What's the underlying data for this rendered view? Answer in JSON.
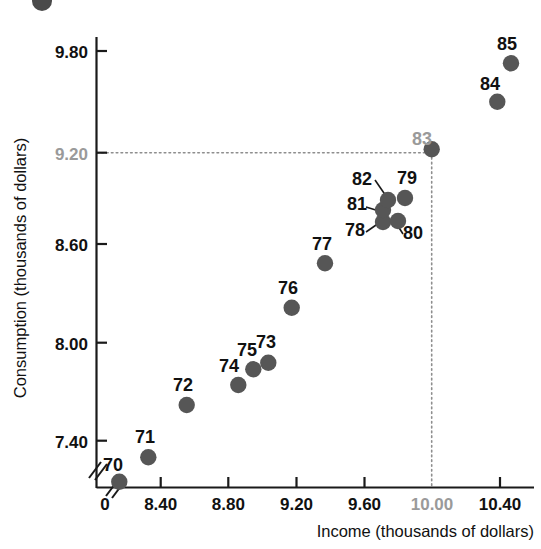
{
  "chart_data": {
    "type": "scatter",
    "title": "",
    "xlabel": "Income (thousands of dollars)",
    "ylabel": "Consumption (thousands of dollars)",
    "xlim": [
      8.1,
      9.3
    ],
    "ylim": [
      7.1,
      9.85
    ],
    "grid": false,
    "legend": "none",
    "axis_break_x": true,
    "axis_break_y": true,
    "x_origin_label": "0",
    "xticks": [
      8.4,
      8.8,
      9.2,
      9.6,
      10.0,
      10.4
    ],
    "xticklabels": [
      "8.40",
      "8.80",
      "9.20",
      "9.60",
      "10.00",
      "10.40"
    ],
    "yticks": [
      7.4,
      8.0,
      8.6,
      9.2,
      9.8
    ],
    "yticklabels": [
      "7.40",
      "8.00",
      "8.60",
      "9.20",
      "9.80"
    ],
    "highlighted_xtick": "10.00",
    "highlighted_ytick": "9.20",
    "highlighted_point": "83",
    "guide_lines": {
      "x": 10.0,
      "y": 9.2,
      "style": "dotted",
      "color": "#8e8e8e"
    },
    "point_color": "#565656",
    "label_color": "#111111",
    "highlight_color": "#9a9a9a",
    "points": [
      {
        "label": "70",
        "x": 8.16,
        "y": 7.15,
        "px": 119.3,
        "py": 481.7,
        "lx": 103,
        "ly": 471,
        "leader": false,
        "highlight": false
      },
      {
        "label": "71",
        "x": 8.32,
        "y": 7.4,
        "px": 148.3,
        "py": 457.3,
        "lx": 135,
        "ly": 443,
        "leader": false,
        "highlight": false
      },
      {
        "label": "72",
        "x": 8.46,
        "y": 7.77,
        "px": 186.7,
        "py": 405.0,
        "lx": 173,
        "ly": 391,
        "leader": false,
        "highlight": false
      },
      {
        "label": "73",
        "x": 8.66,
        "y": 7.88,
        "px": 268.3,
        "py": 362.7,
        "lx": 256,
        "ly": 348,
        "leader": false,
        "highlight": false
      },
      {
        "label": "74",
        "x": 8.58,
        "y": 7.74,
        "px": 238.3,
        "py": 385.0,
        "lx": 219,
        "ly": 372,
        "leader": false,
        "highlight": false
      },
      {
        "label": "75",
        "x": 8.62,
        "y": 7.84,
        "px": 253.3,
        "py": 369.3,
        "lx": 237,
        "ly": 356,
        "leader": false,
        "highlight": false
      },
      {
        "label": "76",
        "x": 8.71,
        "y": 8.16,
        "px": 291.7,
        "py": 307.7,
        "lx": 278,
        "ly": 294,
        "leader": false,
        "highlight": false
      },
      {
        "label": "77",
        "x": 8.79,
        "y": 8.53,
        "px": 325.0,
        "py": 263.3,
        "lx": 312,
        "ly": 250,
        "leader": false,
        "highlight": false
      },
      {
        "label": "78",
        "x": 8.93,
        "y": 8.75,
        "px": 383.0,
        "py": 222.0,
        "lx": 345,
        "ly": 236,
        "leader": true,
        "highlight": false
      },
      {
        "label": "79",
        "x": 9.0,
        "y": 8.89,
        "px": 405.0,
        "py": 198.0,
        "lx": 397,
        "ly": 184,
        "leader": false,
        "highlight": false
      },
      {
        "label": "80",
        "x": 8.97,
        "y": 8.76,
        "px": 398.0,
        "py": 221.0,
        "lx": 403,
        "ly": 239,
        "leader": true,
        "highlight": false
      },
      {
        "label": "81",
        "x": 8.93,
        "y": 8.82,
        "px": 383.0,
        "py": 210.0,
        "lx": 347,
        "ly": 210,
        "leader": true,
        "highlight": false
      },
      {
        "label": "82",
        "x": 8.95,
        "y": 8.88,
        "px": 388.0,
        "py": 200.0,
        "lx": 352,
        "ly": 185,
        "leader": true,
        "highlight": false
      },
      {
        "label": "83",
        "x": 9.04,
        "y": 9.2,
        "px": 431.7,
        "py": 149.3,
        "lx": 412,
        "ly": 145,
        "leader": false,
        "highlight": true
      },
      {
        "label": "84",
        "x": 9.2,
        "y": 9.49,
        "px": 497.3,
        "py": 101.7,
        "lx": 480,
        "ly": 90,
        "leader": false,
        "highlight": false
      },
      {
        "label": "85",
        "x": 9.23,
        "y": 9.73,
        "px": 511.0,
        "py": 63.3,
        "lx": 497,
        "ly": 50,
        "leader": false,
        "highlight": false
      }
    ]
  },
  "axes": {
    "y_title": "Consumption (thousands of dollars)",
    "x_title": "Income (thousands of dollars)",
    "origin": "0"
  }
}
